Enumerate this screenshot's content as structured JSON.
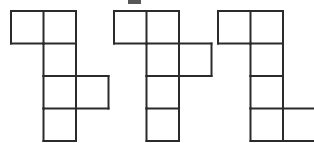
{
  "image": {
    "title": "Three polyomino net figures",
    "width": 314,
    "height": 143,
    "background_color": "#ffffff",
    "stroke_color": "#2b2b2b",
    "stroke_width": 2,
    "cell_size": 32.5,
    "description": "Three hexomino-style grid figures drawn as outlined unit squares on a white background"
  },
  "artifact": {
    "name": "scan-speck",
    "x": 128,
    "y": 0,
    "width": 13,
    "height": 4,
    "color": "#3a3a3a"
  },
  "figures": [
    {
      "id": "figure-1",
      "label": "Figure 1",
      "origin_x": 11,
      "origin_y": 11,
      "cells": [
        {
          "col": 0,
          "row": 0
        },
        {
          "col": 1,
          "row": 0
        },
        {
          "col": 1,
          "row": 1
        },
        {
          "col": 1,
          "row": 2
        },
        {
          "col": 2,
          "row": 2
        },
        {
          "col": 1,
          "row": 3
        }
      ]
    },
    {
      "id": "figure-2",
      "label": "Figure 2",
      "origin_x": 114,
      "origin_y": 11,
      "cells": [
        {
          "col": 0,
          "row": 0
        },
        {
          "col": 1,
          "row": 0
        },
        {
          "col": 1,
          "row": 1
        },
        {
          "col": 2,
          "row": 1
        },
        {
          "col": 1,
          "row": 2
        },
        {
          "col": 1,
          "row": 3
        }
      ]
    },
    {
      "id": "figure-3",
      "label": "Figure 3",
      "origin_x": 218,
      "origin_y": 11,
      "cells": [
        {
          "col": 0,
          "row": 0
        },
        {
          "col": 1,
          "row": 0
        },
        {
          "col": 1,
          "row": 1
        },
        {
          "col": 1,
          "row": 2
        },
        {
          "col": 1,
          "row": 3
        },
        {
          "col": 2,
          "row": 3
        }
      ]
    }
  ]
}
